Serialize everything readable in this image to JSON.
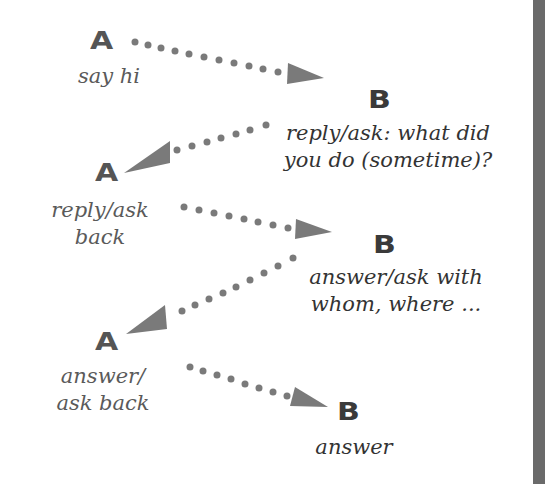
{
  "diagram": {
    "colors": {
      "background": "#ffffff",
      "arrow": "#7a7a7a",
      "letter_a": "#555555",
      "letter_b": "#3a3a3a",
      "text": "#3e3e3e",
      "edge_bar": "#6a6a6a"
    },
    "nodes": [
      {
        "id": "a1",
        "speaker": "A",
        "label_lines": [
          "say hi"
        ]
      },
      {
        "id": "b1",
        "speaker": "B",
        "label_lines": [
          "reply/ask: what did",
          "you do (sometime)?"
        ]
      },
      {
        "id": "a2",
        "speaker": "A",
        "label_lines": [
          "reply/ask",
          "back"
        ]
      },
      {
        "id": "b2",
        "speaker": "B",
        "label_lines": [
          "answer/ask with",
          "whom, where ..."
        ]
      },
      {
        "id": "a3",
        "speaker": "A",
        "label_lines": [
          "answer/",
          "ask back"
        ]
      },
      {
        "id": "b3",
        "speaker": "B",
        "label_lines": [
          "answer"
        ]
      }
    ],
    "edges": [
      {
        "from": "a1",
        "to": "b1",
        "style": "dotted-arrow"
      },
      {
        "from": "b1",
        "to": "a2",
        "style": "dotted-arrow"
      },
      {
        "from": "a2",
        "to": "b2",
        "style": "dotted-arrow"
      },
      {
        "from": "b2",
        "to": "a3",
        "style": "dotted-arrow"
      },
      {
        "from": "a3",
        "to": "b3",
        "style": "dotted-arrow"
      }
    ]
  }
}
